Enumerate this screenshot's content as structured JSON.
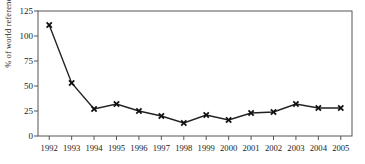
{
  "chart_data": {
    "type": "line",
    "title": "",
    "subtitle": "",
    "xlabel": "",
    "ylabel": "% of world reference price",
    "categories": [
      "1992",
      "1993",
      "1994",
      "1995",
      "1996",
      "1997",
      "1998",
      "1999",
      "2000",
      "2001",
      "2002",
      "2003",
      "2004",
      "2005"
    ],
    "values": [
      111,
      53,
      27,
      32,
      25,
      20,
      13,
      21,
      16,
      23,
      24,
      32,
      28,
      28
    ],
    "series": [
      {
        "name": "% of world reference price",
        "values": [
          111,
          53,
          27,
          32,
          25,
          20,
          13,
          21,
          16,
          23,
          24,
          32,
          28,
          28
        ]
      }
    ],
    "ylim": [
      0,
      125
    ],
    "yticks": [
      0,
      25,
      50,
      75,
      100,
      125
    ],
    "ytick_labels": [
      "0",
      "25",
      "50",
      "75",
      "100",
      "125"
    ],
    "xtick_labels": [
      "1992",
      "1993",
      "1994",
      "1995",
      "1996",
      "1997",
      "1998",
      "1999",
      "2000",
      "2001",
      "2002",
      "2003",
      "2004",
      "2005"
    ],
    "grid": false,
    "legend": false,
    "legend_position": "none",
    "marker": "x",
    "line_color": "#222222",
    "marker_color": "#111111",
    "axis_color": "#555555",
    "background_color": "#ffffff",
    "annotations": []
  },
  "colors": {
    "line": "#222222",
    "marker": "#111111",
    "axis": "#555555",
    "text": "#1a1a1a",
    "background": "#ffffff"
  }
}
